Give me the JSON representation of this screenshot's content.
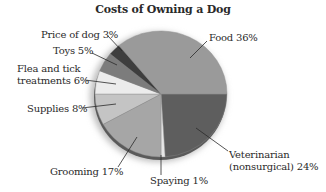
{
  "chart_data": {
    "type": "pie",
    "title": "Costs of Owning a Dog",
    "categories": [
      "Food",
      "Veterinarian (nonsurgical)",
      "Spaying",
      "Grooming",
      "Supplies",
      "Flea and tick treatments",
      "Toys",
      "Price of dog"
    ],
    "values": [
      36,
      24,
      1,
      17,
      8,
      6,
      5,
      3
    ],
    "unit": "%",
    "colors": [
      "#9a9a9a",
      "#5e5e5e",
      "#e6e6e6",
      "#a6a6a6",
      "#c4c4c4",
      "#ececec",
      "#7c7c7c",
      "#3e3e3e"
    ],
    "labels": [
      {
        "text": "Food 36%"
      },
      {
        "text": "Veterinarian",
        "text2": "(nonsurgical) 24%"
      },
      {
        "text": "Spaying 1%"
      },
      {
        "text": "Grooming 17%"
      },
      {
        "text": "Supplies 8%"
      },
      {
        "text": "Flea and tick",
        "text2": "treatments 6%"
      },
      {
        "text": "Toys 5%"
      },
      {
        "text": "Price of dog 3%"
      }
    ],
    "legend": "none (leader-line labels)",
    "start_angle_deg": 0,
    "direction": "clockwise from 3 o'clock, Veterinarian first; Food ends at 3 o'clock"
  }
}
